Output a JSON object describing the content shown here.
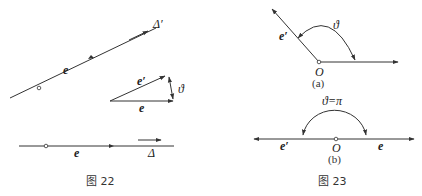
{
  "figure22": {
    "caption": "图 22",
    "top_line": {
      "vector_label": "e",
      "axis_label": "Δ′"
    },
    "triangle": {
      "e_prime_label": "e′",
      "e_label": "e",
      "angle_label": "ϑ"
    },
    "bottom_line": {
      "vector_label": "e",
      "axis_label": "Δ"
    }
  },
  "figure23": {
    "caption": "图 23",
    "part_a": {
      "sublabel": "(a)",
      "origin_label": "O",
      "e_prime_label": "e′",
      "angle_label": "ϑ"
    },
    "part_b": {
      "sublabel": "(b)",
      "origin_label": "O",
      "e_prime_label": "e′",
      "e_label": "e",
      "angle_label": "ϑ=π"
    }
  },
  "colors": {
    "line": "#333333",
    "text": "#222222",
    "background": "#ffffff"
  }
}
